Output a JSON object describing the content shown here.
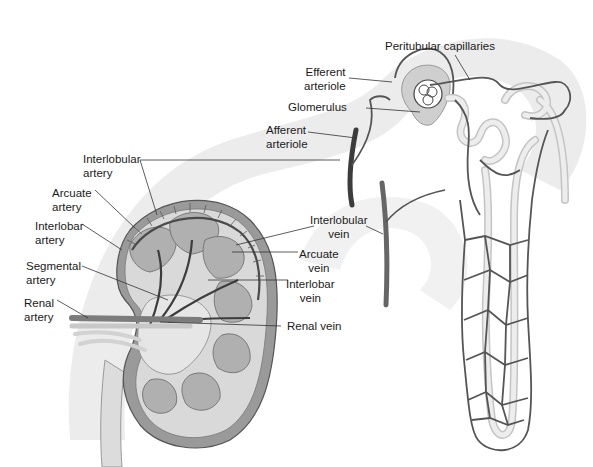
{
  "figure": {
    "colors": {
      "background": "#ffffff",
      "arc_band": "#ececec",
      "vessel": "#555555",
      "artery_dark": "#3c3c3c",
      "tubule": "#e2e2e2",
      "tubule_edge": "#c4c4c4",
      "kidney_cortex": "#d6d6d6",
      "kidney_medulla": "#b5b5b5",
      "capsule": "#8a8a8a",
      "leader_line": "#333333",
      "text": "#1a1a1a"
    }
  },
  "labels": {
    "peritubular_capillaries": "Peritubular capillaries",
    "efferent_arteriole": "Efferent\narteriole",
    "glomerulus": "Glomerulus",
    "afferent_arteriole": "Afferent\narteriole",
    "interlobular_artery": "Interlobular\nartery",
    "arcuate_artery": "Arcuate\nartery",
    "interlobar_artery": "Interlobar\nartery",
    "segmental_artery": "Segmental\nartery",
    "renal_artery": "Renal\nartery",
    "interlobular_vein": "Interlobular\nvein",
    "arcuate_vein": "Arcuate\nvein",
    "interlobar_vein": "Interlobar\nvein",
    "renal_vein": "Renal vein"
  }
}
